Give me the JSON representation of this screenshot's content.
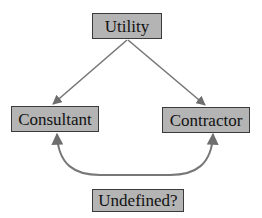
{
  "diagram": {
    "type": "flow",
    "nodes": [
      {
        "id": "utility",
        "label": "Utility"
      },
      {
        "id": "consultant",
        "label": "Consultant"
      },
      {
        "id": "contractor",
        "label": "Contractor"
      },
      {
        "id": "undefined",
        "label": "Undefined?"
      }
    ],
    "edges": [
      {
        "from": "utility",
        "to": "consultant",
        "style": "straight-arrow"
      },
      {
        "from": "utility",
        "to": "contractor",
        "style": "straight-arrow"
      },
      {
        "from": "contractor",
        "to": "consultant",
        "style": "curved-bidirectional-arrow",
        "via": "bottom"
      }
    ],
    "colors": {
      "node_fill": "#b4b4b4",
      "node_border": "#3a3a3a",
      "edge": "#777777",
      "text": "#111111",
      "background": "#ffffff"
    }
  }
}
